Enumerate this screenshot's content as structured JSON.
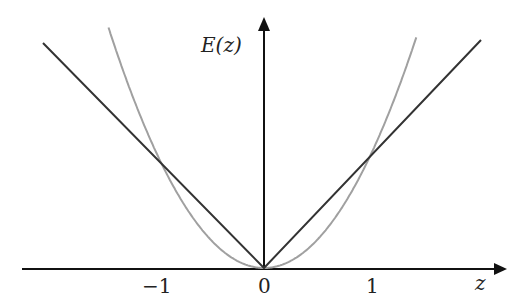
{
  "chart_data": {
    "type": "line",
    "title": "",
    "xlabel": "z",
    "ylabel": "E(z)",
    "x_ticks": [
      "−1",
      "0",
      "1"
    ],
    "xlim": [
      -2.2,
      2.2
    ],
    "ylim": [
      0,
      2.1
    ],
    "grid": false,
    "legend": null,
    "series": [
      {
        "name": "|z|",
        "color": "#333333",
        "function": "abs(z)",
        "x": [
          -2.05,
          0,
          2.0
        ],
        "y": [
          2.05,
          0,
          2.0
        ]
      },
      {
        "name": "z^2",
        "color": "#9a9a9a",
        "function": "z^2",
        "x": [
          -1.45,
          -1,
          0,
          1,
          1.41
        ],
        "y": [
          2.1,
          1,
          0,
          1,
          2.0
        ]
      }
    ]
  },
  "labels": {
    "y_axis": "E(z)",
    "x_axis": "z",
    "tick_neg1": "−1",
    "tick_0": "0",
    "tick_1": "1"
  }
}
